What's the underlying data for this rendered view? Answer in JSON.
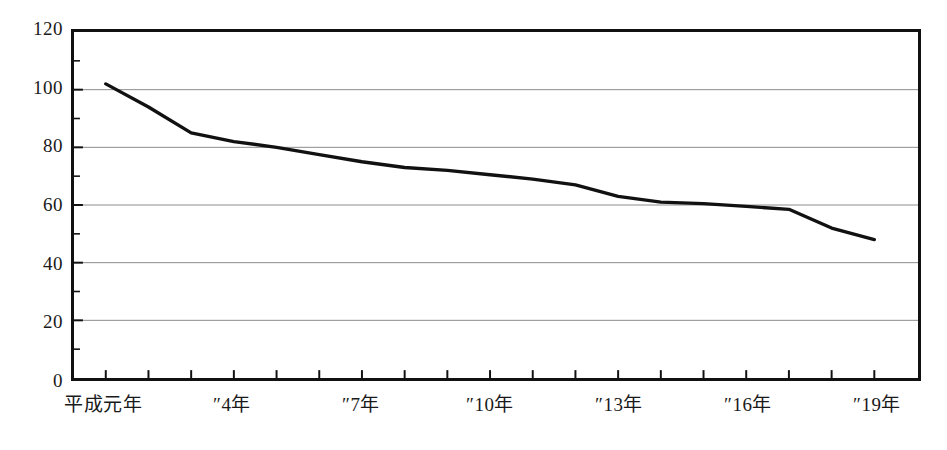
{
  "chart_data": {
    "type": "line",
    "title": "",
    "subtitle": "",
    "xlabel": "",
    "ylabel": "",
    "ylim": [
      0,
      120
    ],
    "ytick_values": [
      0,
      20,
      40,
      60,
      80,
      100,
      120
    ],
    "ytick_labels": [
      "0",
      "20",
      "40",
      "60",
      "80",
      "100",
      "120"
    ],
    "y_minor_tick_step": 10,
    "grid": "horizontal",
    "legend": "none",
    "x": [
      "平成元年",
      "″2年",
      "″3年",
      "″4年",
      "″5年",
      "″6年",
      "″7年",
      "″8年",
      "″9年",
      "″10年",
      "″11年",
      "″12年",
      "″13年",
      "″14年",
      "″15年",
      "″16年",
      "″17年",
      "″18年",
      "″19年"
    ],
    "xtick_labels_shown": [
      {
        "index": 0,
        "label": "平成元年"
      },
      {
        "index": 3,
        "label": "″4年"
      },
      {
        "index": 6,
        "label": "″7年"
      },
      {
        "index": 9,
        "label": "″10年"
      },
      {
        "index": 12,
        "label": "″13年"
      },
      {
        "index": 15,
        "label": "″16年"
      },
      {
        "index": 18,
        "label": "″19年"
      }
    ],
    "series": [
      {
        "name": "",
        "color": "#111111",
        "values": [
          102,
          94,
          85,
          82,
          80,
          77.5,
          75,
          73,
          72,
          70.5,
          69,
          67,
          63,
          61,
          60.5,
          59.5,
          58.5,
          52,
          48
        ]
      }
    ]
  },
  "axis": {
    "line_color": "#111111",
    "grid_color": "#8a8a8a",
    "background": "#ffffff"
  }
}
